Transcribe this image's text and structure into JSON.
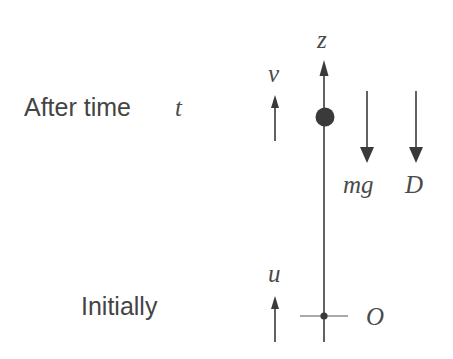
{
  "diagram": {
    "stages": {
      "after": {
        "label": "After time",
        "time_symbol": "t",
        "velocity_symbol": "v",
        "velocity_direction": "up",
        "forces": [
          {
            "symbol": "mg",
            "direction": "down"
          },
          {
            "symbol": "D",
            "direction": "down"
          }
        ]
      },
      "initial": {
        "label": "Initially",
        "velocity_symbol": "u",
        "velocity_direction": "up"
      }
    },
    "axis": {
      "symbol": "z",
      "direction": "up",
      "origin_symbol": "O"
    },
    "colors": {
      "ink": "#3a3a3a",
      "text": "#444444",
      "background": "#ffffff"
    }
  }
}
